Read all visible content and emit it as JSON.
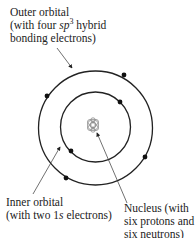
{
  "labels": {
    "outer": {
      "line1": "Outer orbital",
      "line2_pre": "(with four ",
      "line2_sp": "sp",
      "line2_sup": "3",
      "line2_post": " hybrid",
      "line3": "bonding electrons)"
    },
    "inner": {
      "line1": "Inner orbital",
      "line2_pre": "(with two 1",
      "line2_s": "s",
      "line2_post": " electrons)"
    },
    "nucleus": {
      "line1": "Nucleus (with",
      "line2": "six protons and",
      "line3": "six neutrons)"
    }
  },
  "diagram": {
    "center": [
      95,
      127
    ],
    "outer_radius": 57,
    "inner_radius": 35,
    "outer_electrons": 4,
    "inner_electrons": 2,
    "stroke_color": "#222222",
    "nucleus_color": "#888888"
  }
}
